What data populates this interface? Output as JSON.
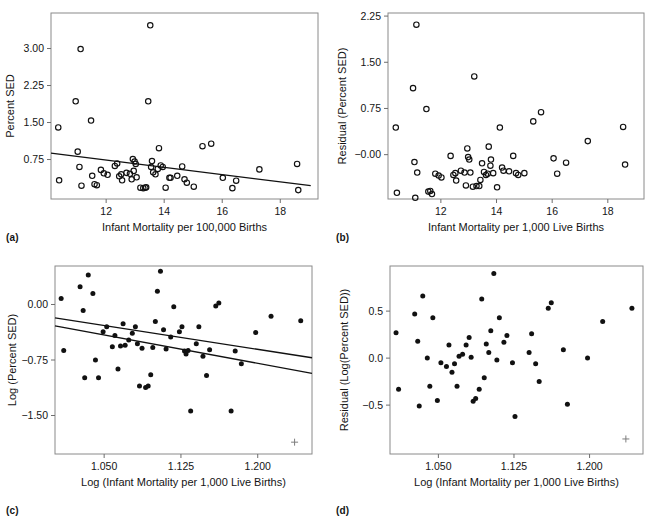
{
  "figure": {
    "panels": [
      {
        "id": "a",
        "caption": "(a)",
        "chart_data": {
          "type": "scatter",
          "title": "",
          "xlabel": "Infant Mortality per 100,000 Births",
          "ylabel": "Percent SED",
          "marker": "open-circle",
          "xlim": [
            10.1,
            19.3
          ],
          "ylim": [
            -0.05,
            3.72
          ],
          "xticks": [
            12,
            14,
            16,
            18
          ],
          "xticklabels": [
            "12",
            "14",
            "16",
            "18"
          ],
          "yticks": [
            0.75,
            1.5,
            2.25,
            3.0
          ],
          "yticklabels": [
            "0.75",
            "1.50",
            "2.25",
            "3.00"
          ],
          "grid": false,
          "legend": "none",
          "points": [
            [
              10.35,
              1.4
            ],
            [
              10.38,
              0.33
            ],
            [
              10.95,
              1.93
            ],
            [
              11.02,
              0.91
            ],
            [
              11.12,
              2.99
            ],
            [
              11.08,
              0.6
            ],
            [
              11.15,
              0.22
            ],
            [
              11.48,
              1.54
            ],
            [
              11.52,
              0.42
            ],
            [
              11.6,
              0.25
            ],
            [
              11.68,
              0.23
            ],
            [
              11.82,
              0.54
            ],
            [
              11.92,
              0.47
            ],
            [
              12.05,
              0.44
            ],
            [
              12.3,
              0.62
            ],
            [
              12.38,
              0.67
            ],
            [
              12.45,
              0.41
            ],
            [
              12.52,
              0.45
            ],
            [
              12.55,
              0.33
            ],
            [
              12.7,
              0.48
            ],
            [
              12.82,
              0.46
            ],
            [
              12.88,
              0.35
            ],
            [
              12.92,
              0.76
            ],
            [
              12.95,
              0.52
            ],
            [
              12.98,
              0.71
            ],
            [
              13.02,
              0.66
            ],
            [
              13.05,
              0.39
            ],
            [
              13.18,
              0.18
            ],
            [
              13.28,
              0.17
            ],
            [
              13.35,
              0.18
            ],
            [
              13.38,
              0.19
            ],
            [
              13.45,
              1.93
            ],
            [
              13.52,
              3.47
            ],
            [
              13.55,
              0.6
            ],
            [
              13.58,
              0.72
            ],
            [
              13.62,
              0.49
            ],
            [
              13.7,
              0.45
            ],
            [
              13.78,
              0.56
            ],
            [
              13.82,
              0.98
            ],
            [
              13.88,
              0.63
            ],
            [
              13.95,
              0.6
            ],
            [
              14.05,
              0.18
            ],
            [
              14.18,
              0.38
            ],
            [
              14.22,
              0.38
            ],
            [
              14.45,
              0.42
            ],
            [
              14.62,
              0.61
            ],
            [
              14.7,
              0.35
            ],
            [
              14.78,
              0.28
            ],
            [
              15.02,
              0.2
            ],
            [
              15.32,
              1.02
            ],
            [
              15.62,
              1.07
            ],
            [
              16.02,
              0.38
            ],
            [
              16.35,
              0.17
            ],
            [
              16.48,
              0.32
            ],
            [
              17.28,
              0.55
            ],
            [
              18.58,
              0.66
            ],
            [
              18.62,
              0.13
            ]
          ],
          "fit_lines": [
            {
              "x0": 10.1,
              "y0": 0.88,
              "x1": 19.05,
              "y1": 0.22
            }
          ]
        }
      },
      {
        "id": "b",
        "caption": "(b)",
        "chart_data": {
          "type": "scatter",
          "title": "",
          "xlabel": "Infant Mortality per 1,000 Live Births",
          "ylabel": "Residual (Percent SED)",
          "marker": "open-circle",
          "xlim": [
            10.1,
            19.3
          ],
          "ylim": [
            -0.72,
            2.3
          ],
          "xticks": [
            12,
            14,
            16,
            18
          ],
          "xticklabels": [
            "12",
            "14",
            "16",
            "18"
          ],
          "yticks": [
            -0.0,
            0.75,
            1.5,
            2.25
          ],
          "yticklabels": [
            "−0.00",
            "0.75",
            "1.50",
            "2.25"
          ],
          "grid": false,
          "legend": "none",
          "points": [
            [
              10.38,
              0.44
            ],
            [
              10.42,
              -0.62
            ],
            [
              11.0,
              1.08
            ],
            [
              11.05,
              -0.12
            ],
            [
              11.08,
              -0.7
            ],
            [
              11.12,
              2.11
            ],
            [
              11.15,
              -0.29
            ],
            [
              11.48,
              0.74
            ],
            [
              11.55,
              -0.6
            ],
            [
              11.62,
              -0.59
            ],
            [
              11.68,
              -0.64
            ],
            [
              11.8,
              -0.31
            ],
            [
              11.92,
              -0.34
            ],
            [
              12.02,
              -0.37
            ],
            [
              12.35,
              -0.02
            ],
            [
              12.45,
              -0.33
            ],
            [
              12.52,
              -0.3
            ],
            [
              12.55,
              -0.42
            ],
            [
              12.72,
              -0.26
            ],
            [
              12.85,
              -0.29
            ],
            [
              12.9,
              -0.5
            ],
            [
              12.95,
              0.1
            ],
            [
              12.98,
              -0.04
            ],
            [
              13.02,
              -0.08
            ],
            [
              13.06,
              -0.29
            ],
            [
              13.15,
              -0.52
            ],
            [
              13.2,
              1.27
            ],
            [
              13.28,
              -0.51
            ],
            [
              13.38,
              -0.51
            ],
            [
              13.42,
              -0.41
            ],
            [
              13.48,
              -0.14
            ],
            [
              13.55,
              -0.28
            ],
            [
              13.62,
              -0.33
            ],
            [
              13.68,
              -0.31
            ],
            [
              13.72,
              0.13
            ],
            [
              13.78,
              -0.18
            ],
            [
              13.8,
              -0.08
            ],
            [
              13.88,
              -0.3
            ],
            [
              14.02,
              -0.53
            ],
            [
              14.12,
              0.44
            ],
            [
              14.2,
              -0.21
            ],
            [
              14.25,
              -0.26
            ],
            [
              14.45,
              -0.27
            ],
            [
              14.6,
              -0.02
            ],
            [
              14.7,
              -0.3
            ],
            [
              14.78,
              -0.33
            ],
            [
              15.0,
              -0.3
            ],
            [
              15.32,
              0.54
            ],
            [
              15.6,
              0.69
            ],
            [
              16.05,
              -0.06
            ],
            [
              16.18,
              -0.31
            ],
            [
              16.5,
              -0.13
            ],
            [
              17.28,
              0.22
            ],
            [
              18.55,
              0.45
            ],
            [
              18.62,
              -0.16
            ]
          ],
          "fit_lines": []
        }
      },
      {
        "id": "c",
        "caption": "(c)",
        "chart_data": {
          "type": "scatter",
          "title": "",
          "xlabel": "Log (Infant Mortality per 1,000 Live Births)",
          "ylabel": "Log (Percent SED)",
          "marker": "filled-circle",
          "xlim": [
            1.002,
            1.253
          ],
          "ylim": [
            -2.02,
            0.52
          ],
          "xticks": [
            1.05,
            1.125,
            1.2
          ],
          "xticklabels": [
            "1.050",
            "1.125",
            "1.200"
          ],
          "yticks": [
            -1.5,
            -0.75,
            0.0
          ],
          "yticklabels": [
            "−1.50",
            "−0.75",
            "0.00"
          ],
          "grid": false,
          "legend": "none",
          "points": [
            [
              1.008,
              0.08
            ],
            [
              1.0105,
              -0.62
            ],
            [
              1.0265,
              0.24
            ],
            [
              1.0295,
              -0.08
            ],
            [
              1.031,
              -0.99
            ],
            [
              1.0345,
              0.4
            ],
            [
              1.039,
              0.15
            ],
            [
              1.0415,
              -0.75
            ],
            [
              1.0445,
              -0.99
            ],
            [
              1.049,
              -0.37
            ],
            [
              1.0525,
              -0.3
            ],
            [
              1.058,
              -0.57
            ],
            [
              1.0605,
              -0.42
            ],
            [
              1.0635,
              -0.87
            ],
            [
              1.066,
              -0.56
            ],
            [
              1.0685,
              -0.26
            ],
            [
              1.0705,
              -0.55
            ],
            [
              1.074,
              -0.48
            ],
            [
              1.0775,
              -0.39
            ],
            [
              1.0805,
              -0.3
            ],
            [
              1.0825,
              -0.53
            ],
            [
              1.0845,
              -1.1
            ],
            [
              1.087,
              -0.59
            ],
            [
              1.0905,
              -1.12
            ],
            [
              1.093,
              -1.1
            ],
            [
              1.0955,
              -0.95
            ],
            [
              1.0975,
              -0.58
            ],
            [
              1.1,
              -0.23
            ],
            [
              1.102,
              0.18
            ],
            [
              1.105,
              0.45
            ],
            [
              1.108,
              -0.34
            ],
            [
              1.1105,
              -0.6
            ],
            [
              1.115,
              -0.44
            ],
            [
              1.118,
              -0.03
            ],
            [
              1.1235,
              -0.37
            ],
            [
              1.126,
              -0.3
            ],
            [
              1.1285,
              -0.63
            ],
            [
              1.13,
              -0.67
            ],
            [
              1.132,
              -0.62
            ],
            [
              1.1345,
              -1.44
            ],
            [
              1.14,
              -0.53
            ],
            [
              1.1425,
              -0.3
            ],
            [
              1.1465,
              -0.7
            ],
            [
              1.15,
              -0.96
            ],
            [
              1.153,
              -0.61
            ],
            [
              1.159,
              -0.02
            ],
            [
              1.162,
              0.02
            ],
            [
              1.174,
              -1.44
            ],
            [
              1.178,
              -0.63
            ],
            [
              1.184,
              -0.8
            ],
            [
              1.198,
              -0.38
            ],
            [
              1.213,
              -0.16
            ],
            [
              1.242,
              -0.22
            ]
          ],
          "fit_lines": [
            {
              "x0": 1.002,
              "y0": -0.18,
              "x1": 1.253,
              "y1": -0.72
            },
            {
              "x0": 1.002,
              "y0": -0.29,
              "x1": 1.253,
              "y1": -0.93
            }
          ],
          "plus_marker": {
            "x": 1.236,
            "y": -1.86
          }
        }
      },
      {
        "id": "d",
        "caption": "(d)",
        "chart_data": {
          "type": "scatter",
          "title": "",
          "xlabel": "Log (Infant Mortality per 1,000 Live Births)",
          "ylabel": "Residual (Log(Percent SED))",
          "marker": "filled-circle",
          "xlim": [
            1.002,
            1.253
          ],
          "ylim": [
            -1.02,
            0.98
          ],
          "xticks": [
            1.05,
            1.125,
            1.2
          ],
          "xticklabels": [
            "1.050",
            "1.125",
            "1.200"
          ],
          "yticks": [
            -0.5,
            0.0,
            0.5
          ],
          "yticklabels": [
            "−0.5",
            "0.0",
            "0.5"
          ],
          "grid": false,
          "legend": "none",
          "points": [
            [
              1.008,
              0.27
            ],
            [
              1.0105,
              -0.33
            ],
            [
              1.0265,
              0.47
            ],
            [
              1.0295,
              0.18
            ],
            [
              1.031,
              -0.51
            ],
            [
              1.0345,
              0.66
            ],
            [
              1.039,
              0.0
            ],
            [
              1.0415,
              -0.3
            ],
            [
              1.0445,
              0.43
            ],
            [
              1.049,
              -0.45
            ],
            [
              1.0525,
              -0.05
            ],
            [
              1.058,
              -0.09
            ],
            [
              1.0605,
              0.14
            ],
            [
              1.0635,
              -0.15
            ],
            [
              1.066,
              -0.06
            ],
            [
              1.0685,
              -0.3
            ],
            [
              1.0705,
              0.02
            ],
            [
              1.074,
              0.04
            ],
            [
              1.0775,
              0.14
            ],
            [
              1.0805,
              0.22
            ],
            [
              1.0825,
              0.01
            ],
            [
              1.0845,
              -0.46
            ],
            [
              1.087,
              -0.43
            ],
            [
              1.0905,
              -0.33
            ],
            [
              1.093,
              0.63
            ],
            [
              1.0955,
              -0.21
            ],
            [
              1.0975,
              0.15
            ],
            [
              1.1,
              0.06
            ],
            [
              1.102,
              0.29
            ],
            [
              1.105,
              0.9
            ],
            [
              1.108,
              -0.02
            ],
            [
              1.1105,
              0.43
            ],
            [
              1.115,
              0.17
            ],
            [
              1.118,
              0.24
            ],
            [
              1.1235,
              -0.05
            ],
            [
              1.126,
              -0.62
            ],
            [
              1.14,
              0.06
            ],
            [
              1.1425,
              0.26
            ],
            [
              1.1465,
              -0.06
            ],
            [
              1.15,
              -0.25
            ],
            [
              1.159,
              0.53
            ],
            [
              1.162,
              0.59
            ],
            [
              1.174,
              0.09
            ],
            [
              1.178,
              -0.49
            ],
            [
              1.198,
              0.0
            ],
            [
              1.213,
              0.39
            ],
            [
              1.242,
              0.53
            ]
          ],
          "fit_lines": [],
          "plus_marker": {
            "x": 1.236,
            "y": -0.86
          }
        }
      }
    ]
  }
}
